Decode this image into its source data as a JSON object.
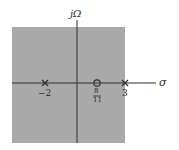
{
  "diagram": {
    "type": "pole-zero plot (s-plane)",
    "region_color": "#a9a9a9",
    "axis_color": "#2e2e2e",
    "axes": {
      "vertical_label": "jΩ",
      "horizontal_label": "σ"
    },
    "poles": [
      {
        "label": "−2",
        "value": -2
      },
      {
        "label": "3",
        "value": 3
      }
    ],
    "zeros": [
      {
        "label_num": "8",
        "label_den": "11",
        "value": 0.7273
      }
    ]
  }
}
